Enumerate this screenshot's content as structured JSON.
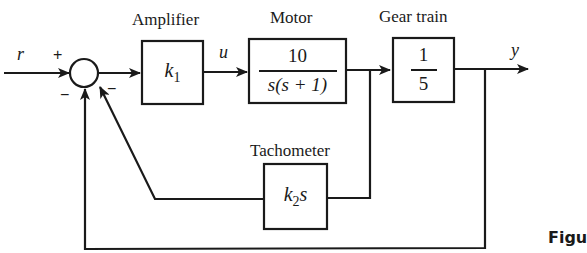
{
  "diagram": {
    "type": "block-diagram",
    "signals": {
      "input": "r",
      "control": "u",
      "output": "y"
    },
    "summing_junction": {
      "signs": {
        "input": "+",
        "feedback_outer": "−",
        "feedback_inner": "−"
      }
    },
    "blocks": {
      "amplifier": {
        "label": "Amplifier",
        "gain_main": "k",
        "gain_sub": "1"
      },
      "motor": {
        "label": "Motor",
        "numerator": "10",
        "denominator": "s(s + 1)"
      },
      "gear_train": {
        "label": "Gear train",
        "numerator": "1",
        "denominator": "5"
      },
      "tachometer": {
        "label": "Tachometer",
        "gain_main": "k",
        "gain_sub": "2",
        "gain_suffix": "s"
      }
    },
    "caption_fragment": "Figu",
    "colors": {
      "ink": "#1a1a1a",
      "background": "#ffffff"
    }
  }
}
